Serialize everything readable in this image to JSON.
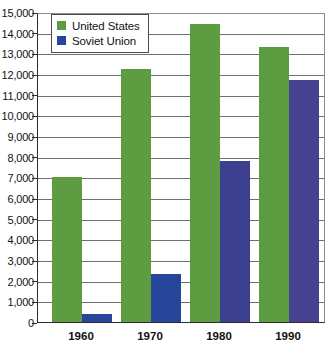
{
  "chart_data": {
    "type": "bar",
    "title": "",
    "xlabel": "",
    "ylabel": "",
    "categories": [
      "1960",
      "1970",
      "1980",
      "1990"
    ],
    "series": [
      {
        "name": "United States",
        "color": "#5e9c41",
        "values": [
          7000,
          12250,
          14400,
          13300
        ]
      },
      {
        "name": "Soviet Union",
        "color": "#27459b",
        "values": [
          400,
          2300,
          7800,
          11700
        ]
      }
    ],
    "bar_colors": {
      "united_states": [
        "#5e9c41",
        "#5e9c41",
        "#5e9c41",
        "#5e9c41"
      ],
      "soviet_union": [
        "#27459b",
        "#27459b",
        "#3b3f8e",
        "#464291"
      ]
    },
    "ylim": [
      0,
      15000
    ],
    "yticks": [
      0,
      1000,
      2000,
      3000,
      4000,
      5000,
      6000,
      7000,
      8000,
      9000,
      10000,
      11000,
      12000,
      13000,
      14000,
      15000
    ],
    "ytick_labels": [
      "0",
      "1,000",
      "2,000",
      "3,000",
      "4,000",
      "5,000",
      "6,000",
      "7,000",
      "8,000",
      "9,000",
      "10,000",
      "11,000",
      "12,000",
      "13,000",
      "14,000",
      "15,000"
    ],
    "grid": true,
    "legend_position": "top-left",
    "legend": [
      {
        "label": "United States",
        "color": "#5e9c41"
      },
      {
        "label": "Soviet Union",
        "color": "#27459b"
      }
    ]
  }
}
